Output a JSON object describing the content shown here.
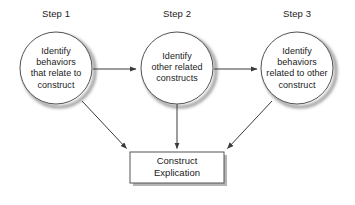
{
  "diagram": {
    "style": {
      "stroke": "#555555",
      "shadow": "#9a9a9a",
      "fill": "#ffffff",
      "text": "#1a1a1a",
      "arrow": "#3a3a3a",
      "background": "#ffffff"
    },
    "steps": [
      {
        "label": "Step 1",
        "label_x": 56,
        "label_y": 8,
        "cx": 56,
        "cy": 68,
        "r": 36,
        "lines": [
          "Identify",
          "behaviors",
          "that relate to",
          "construct"
        ]
      },
      {
        "label": "Step 2",
        "label_x": 177,
        "label_y": 8,
        "cx": 177,
        "cy": 68,
        "r": 36,
        "lines": [
          "Identify",
          "other related",
          "constructs"
        ]
      },
      {
        "label": "Step 3",
        "label_x": 297,
        "label_y": 8,
        "cx": 297,
        "cy": 68,
        "r": 36,
        "lines": [
          "Identify",
          "behaviors",
          "related to other",
          "construct"
        ]
      }
    ],
    "result_box": {
      "x": 130,
      "y": 152,
      "width": 94,
      "height": 31,
      "center_x": 177,
      "center_y": 167,
      "lines": [
        "Construct",
        "Explication"
      ]
    },
    "connectors": [
      {
        "name": "step1-to-step2",
        "type": "horizontal",
        "x1": 93,
        "y1": 69,
        "x2": 138,
        "y2": 69
      },
      {
        "name": "step2-to-step3",
        "type": "horizontal",
        "x1": 214,
        "y1": 69,
        "x2": 259,
        "y2": 69
      },
      {
        "name": "step1-to-result",
        "type": "diagonal",
        "x1": 82,
        "y1": 101,
        "x2": 128,
        "y2": 150
      },
      {
        "name": "step2-to-result",
        "type": "vertical",
        "x1": 177,
        "y1": 104,
        "x2": 177,
        "y2": 150
      },
      {
        "name": "step3-to-result",
        "type": "diagonal",
        "x1": 272,
        "y1": 101,
        "x2": 226,
        "y2": 150
      }
    ]
  }
}
